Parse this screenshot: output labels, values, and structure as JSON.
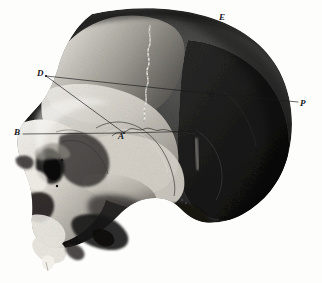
{
  "plate": {
    "kind": "anatomical-engraving",
    "subject": "human skull, lateral view",
    "background_color": "#fdfdfc",
    "ink_color": "#17171a",
    "width": 322,
    "height": 283
  },
  "labels": [
    {
      "id": "E",
      "text": "E",
      "x": 219,
      "y": 13,
      "note": "superior vertex point on cranial vault"
    },
    {
      "id": "P",
      "text": "P",
      "x": 300,
      "y": 99,
      "note": "posterior occipital point"
    },
    {
      "id": "C",
      "text": "C",
      "x": 209,
      "y": 90,
      "note": "point on posterior measurement line"
    },
    {
      "id": "D",
      "text": "D",
      "x": 37,
      "y": 69,
      "note": "anterior frontal vertex of measurement triangle"
    },
    {
      "id": "B",
      "text": "B",
      "x": 14,
      "y": 128,
      "note": "nasion / anterior horizontal baseline point"
    },
    {
      "id": "A",
      "text": "A",
      "x": 118,
      "y": 132,
      "note": "pterion junction point of measurement lines"
    }
  ],
  "measurement_lines": [
    {
      "id": "D-C-P",
      "from": "D",
      "to": "P",
      "description": "long chord from frontal point D through C to occipital point P"
    },
    {
      "id": "D-A",
      "from": "D",
      "to": "A",
      "description": "oblique chord from D down to A"
    },
    {
      "id": "B-A",
      "from": "B",
      "to": "A",
      "description": "horizontal baseline from B to A, continuing right"
    }
  ],
  "anatomy": {
    "features": [
      "cranial vault",
      "coronal suture",
      "squamous suture",
      "temporal fossa",
      "orbital cavity",
      "nasal aperture",
      "zygomatic arch",
      "external auditory meatus",
      "mastoid process",
      "maxilla",
      "upper incisor"
    ]
  }
}
